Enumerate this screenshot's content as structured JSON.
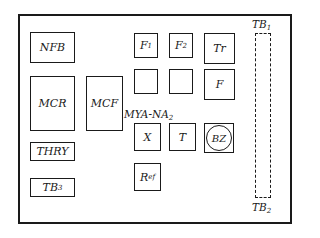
{
  "diagram": {
    "title": "",
    "panel_label": "MYA-NA",
    "panel_label_sub": "2",
    "components": [
      {
        "id": "NFB",
        "label": "NFB",
        "sub": ""
      },
      {
        "id": "MCR",
        "label": "MCR",
        "sub": ""
      },
      {
        "id": "MCF",
        "label": "MCF",
        "sub": ""
      },
      {
        "id": "THRY",
        "label": "THRY",
        "sub": ""
      },
      {
        "id": "TB3",
        "label": "TB",
        "sub": "3"
      },
      {
        "id": "F1",
        "label": "F",
        "sub": "1"
      },
      {
        "id": "F2",
        "label": "F",
        "sub": "2"
      },
      {
        "id": "Tr",
        "label": "Tr",
        "sub": ""
      },
      {
        "id": "blank1",
        "label": "",
        "sub": ""
      },
      {
        "id": "blank2",
        "label": "",
        "sub": ""
      },
      {
        "id": "F",
        "label": "F",
        "sub": ""
      },
      {
        "id": "X",
        "label": "X",
        "sub": ""
      },
      {
        "id": "T",
        "label": "T",
        "sub": ""
      },
      {
        "id": "BZ",
        "label": "BZ",
        "sub": ""
      },
      {
        "id": "Ref",
        "label": "R",
        "sub": "ef"
      }
    ],
    "terminal_block": {
      "top_label": "TB",
      "top_sub": "1",
      "bottom_label": "TB",
      "bottom_sub": "2"
    }
  }
}
